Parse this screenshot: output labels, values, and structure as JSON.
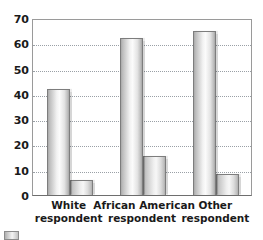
{
  "chart_data": {
    "type": "bar",
    "title": "",
    "subtitle": "",
    "xlabel": "",
    "ylabel": "",
    "ylim": [
      0,
      70
    ],
    "ytick_step": 10,
    "yticks": [
      70,
      60,
      50,
      40,
      30,
      20,
      10,
      0
    ],
    "ytick_labels": [
      "70",
      "60",
      "50",
      "40",
      "30",
      "20",
      "10",
      "0"
    ],
    "grid": true,
    "grid_axis": "y",
    "grid_style": "dotted",
    "legend_position": "bottom-left",
    "categories": [
      "White respondent",
      "African American respondent",
      "Other respondent"
    ],
    "category_lines": [
      [
        "White",
        "respondent"
      ],
      [
        "African American",
        "respondent"
      ],
      [
        "Other",
        "respondent"
      ]
    ],
    "series": [
      {
        "name": "series-1",
        "values": [
          42,
          62,
          65
        ]
      },
      {
        "name": "series-2",
        "values": [
          6,
          15.5,
          8.5
        ]
      }
    ],
    "colors": {
      "bar_fill_light": "#f7f7f7",
      "bar_fill_mid": "#c6c6c6",
      "bar_fill_dark": "#a6a6a6",
      "bar_border": "#7d7d7d",
      "gridline": "#9aa0a6",
      "axis": "#9a9a9a",
      "axis_bottom": "#6e6e6e",
      "text": "#1a1a1a",
      "background": "#ffffff"
    }
  },
  "legend": {
    "swatch_name": "series-swatch"
  }
}
